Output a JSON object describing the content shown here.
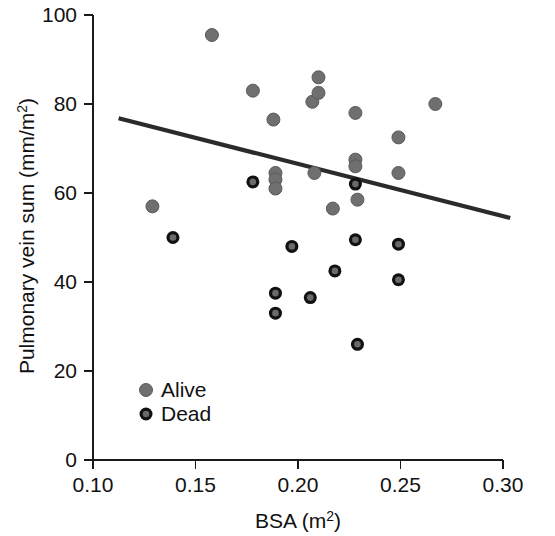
{
  "chart_data": {
    "type": "scatter",
    "title": "",
    "xlabel": "BSA (m2)",
    "xlabel_base": "BSA (m",
    "xlabel_sup": "2",
    "xlabel_tail": ")",
    "ylabel": "Pulmonary vein sum (mm/m2)",
    "ylabel_base": "Pulmonary vein sum (mm/m",
    "ylabel_sup": "2",
    "ylabel_tail": ")",
    "xlim": [
      0.1,
      0.3
    ],
    "ylim": [
      0,
      100
    ],
    "xticks": [
      "0.10",
      "0.15",
      "0.20",
      "0.25",
      "0.30"
    ],
    "xtick_values": [
      0.1,
      0.15,
      0.2,
      0.25,
      0.3
    ],
    "yticks": [
      "0",
      "20",
      "40",
      "60",
      "80",
      "100"
    ],
    "ytick_values": [
      0,
      20,
      40,
      60,
      80,
      100
    ],
    "grid": false,
    "legend_position": "lower-left-inside",
    "legend": [
      {
        "name": "Alive",
        "marker": "filled-gray-circle",
        "color": "#6f6f6f"
      },
      {
        "name": "Dead",
        "marker": "gray-circle-black-ring",
        "color": "#6a6a6a",
        "ring": "#111111"
      }
    ],
    "series": [
      {
        "name": "Alive",
        "marker": "filled-gray-circle",
        "color": "#6f6f6f",
        "points": [
          {
            "x": 0.129,
            "y": 57.0
          },
          {
            "x": 0.158,
            "y": 95.5
          },
          {
            "x": 0.178,
            "y": 83.0
          },
          {
            "x": 0.188,
            "y": 76.5
          },
          {
            "x": 0.189,
            "y": 64.5
          },
          {
            "x": 0.189,
            "y": 63.0
          },
          {
            "x": 0.189,
            "y": 61.0
          },
          {
            "x": 0.207,
            "y": 80.5
          },
          {
            "x": 0.21,
            "y": 82.5
          },
          {
            "x": 0.21,
            "y": 86.0
          },
          {
            "x": 0.208,
            "y": 64.5
          },
          {
            "x": 0.217,
            "y": 56.5
          },
          {
            "x": 0.228,
            "y": 78.0
          },
          {
            "x": 0.228,
            "y": 67.5
          },
          {
            "x": 0.228,
            "y": 66.0
          },
          {
            "x": 0.229,
            "y": 58.5
          },
          {
            "x": 0.249,
            "y": 72.5
          },
          {
            "x": 0.249,
            "y": 64.5
          },
          {
            "x": 0.267,
            "y": 80.0
          }
        ]
      },
      {
        "name": "Dead",
        "marker": "gray-circle-black-ring",
        "color": "#6a6a6a",
        "ring": "#111111",
        "points": [
          {
            "x": 0.139,
            "y": 50.0
          },
          {
            "x": 0.178,
            "y": 62.5
          },
          {
            "x": 0.189,
            "y": 37.5
          },
          {
            "x": 0.189,
            "y": 33.0
          },
          {
            "x": 0.197,
            "y": 48.0
          },
          {
            "x": 0.206,
            "y": 36.5
          },
          {
            "x": 0.218,
            "y": 42.5
          },
          {
            "x": 0.228,
            "y": 62.0
          },
          {
            "x": 0.228,
            "y": 49.5
          },
          {
            "x": 0.229,
            "y": 26.0
          },
          {
            "x": 0.249,
            "y": 48.5
          },
          {
            "x": 0.249,
            "y": 40.5
          }
        ]
      }
    ],
    "fit_line": {
      "name": "regression-line",
      "color": "#2b2b2b",
      "x0": 0.1125,
      "y0": 76.8,
      "x1": 0.3035,
      "y1": 54.4
    }
  }
}
